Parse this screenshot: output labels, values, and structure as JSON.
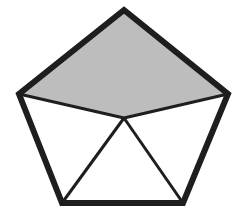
{
  "diagram": {
    "type": "pentagon-dissection",
    "colors": {
      "stroke": "#1e1e1e",
      "shaded_fill": "#bdbdbd",
      "background": "#ffffff"
    },
    "vertices": {
      "top": [
        124,
        10
      ],
      "left": [
        19,
        94
      ],
      "right": [
        228,
        94
      ],
      "bottom_left": [
        62,
        203
      ],
      "bottom_right": [
        183,
        203
      ],
      "interior": [
        124,
        118
      ]
    },
    "shaded_region": "quadrilateral top-left-interior-right",
    "segments": [
      [
        "left",
        "interior"
      ],
      [
        "right",
        "interior"
      ],
      [
        "interior",
        "bottom_left"
      ],
      [
        "interior",
        "bottom_right"
      ]
    ]
  }
}
